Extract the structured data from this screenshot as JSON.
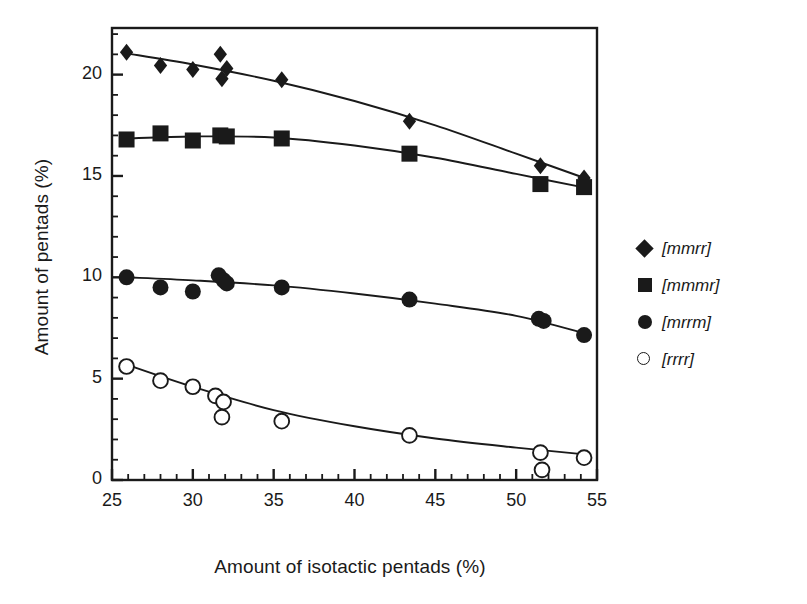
{
  "chart_data": {
    "type": "scatter",
    "title": "",
    "xlabel": "Amount of isotactic pentads (%)",
    "ylabel": "Amount of pentads (%)",
    "xlim": [
      25,
      55
    ],
    "ylim": [
      0,
      22.3
    ],
    "xticks": [
      25,
      30,
      35,
      40,
      45,
      50,
      55
    ],
    "yticks": [
      0,
      5,
      10,
      15,
      20
    ],
    "xtick_labels": [
      "25",
      "30",
      "35",
      "40",
      "45",
      "50",
      "55"
    ],
    "ytick_labels": [
      "0",
      "5",
      "10",
      "15",
      "20"
    ],
    "x_minor_step": 1,
    "y_minor_step": 1,
    "grid": false,
    "legend_position": "right",
    "series": [
      {
        "name": "[mmrr]",
        "marker": "filled-diamond",
        "color": "#1a1a1a",
        "points": [
          {
            "x": 25.9,
            "y": 21.1
          },
          {
            "x": 28.0,
            "y": 20.45
          },
          {
            "x": 30.0,
            "y": 20.25
          },
          {
            "x": 31.7,
            "y": 21.0
          },
          {
            "x": 31.8,
            "y": 19.8
          },
          {
            "x": 32.1,
            "y": 20.3
          },
          {
            "x": 35.5,
            "y": 19.75
          },
          {
            "x": 43.4,
            "y": 17.7
          },
          {
            "x": 51.5,
            "y": 15.5
          },
          {
            "x": 54.2,
            "y": 14.9
          }
        ],
        "fit_curve": [
          {
            "x": 25.9,
            "y": 21.05
          },
          {
            "x": 30.0,
            "y": 20.5
          },
          {
            "x": 35.0,
            "y": 19.7
          },
          {
            "x": 40.0,
            "y": 18.7
          },
          {
            "x": 45.0,
            "y": 17.5
          },
          {
            "x": 50.0,
            "y": 16.1
          },
          {
            "x": 54.4,
            "y": 14.85
          }
        ]
      },
      {
        "name": "[mmmr]",
        "marker": "filled-square",
        "color": "#1a1a1a",
        "points": [
          {
            "x": 25.9,
            "y": 16.8
          },
          {
            "x": 28.0,
            "y": 17.1
          },
          {
            "x": 30.0,
            "y": 16.75
          },
          {
            "x": 31.7,
            "y": 17.0
          },
          {
            "x": 32.1,
            "y": 16.95
          },
          {
            "x": 35.5,
            "y": 16.85
          },
          {
            "x": 43.4,
            "y": 16.1
          },
          {
            "x": 51.5,
            "y": 14.6
          },
          {
            "x": 54.2,
            "y": 14.45
          }
        ],
        "fit_curve": [
          {
            "x": 25.9,
            "y": 16.85
          },
          {
            "x": 30.0,
            "y": 16.95
          },
          {
            "x": 35.0,
            "y": 16.9
          },
          {
            "x": 40.0,
            "y": 16.5
          },
          {
            "x": 45.0,
            "y": 15.9
          },
          {
            "x": 50.0,
            "y": 15.1
          },
          {
            "x": 54.4,
            "y": 14.4
          }
        ]
      },
      {
        "name": "[mrrm]",
        "marker": "filled-circle",
        "color": "#1a1a1a",
        "points": [
          {
            "x": 25.9,
            "y": 10.0
          },
          {
            "x": 28.0,
            "y": 9.5
          },
          {
            "x": 30.0,
            "y": 9.3
          },
          {
            "x": 31.6,
            "y": 10.1
          },
          {
            "x": 31.9,
            "y": 9.85
          },
          {
            "x": 32.1,
            "y": 9.7
          },
          {
            "x": 35.5,
            "y": 9.5
          },
          {
            "x": 43.4,
            "y": 8.9
          },
          {
            "x": 51.4,
            "y": 7.95
          },
          {
            "x": 51.7,
            "y": 7.85
          },
          {
            "x": 54.2,
            "y": 7.15
          }
        ],
        "fit_curve": [
          {
            "x": 25.9,
            "y": 10.0
          },
          {
            "x": 30.0,
            "y": 9.85
          },
          {
            "x": 35.0,
            "y": 9.6
          },
          {
            "x": 40.0,
            "y": 9.2
          },
          {
            "x": 45.0,
            "y": 8.7
          },
          {
            "x": 50.0,
            "y": 8.1
          },
          {
            "x": 54.4,
            "y": 7.2
          }
        ]
      },
      {
        "name": "[rrrr]",
        "marker": "open-circle",
        "color": "#1a1a1a",
        "points": [
          {
            "x": 25.9,
            "y": 5.6
          },
          {
            "x": 28.0,
            "y": 4.9
          },
          {
            "x": 30.0,
            "y": 4.6
          },
          {
            "x": 31.4,
            "y": 4.15
          },
          {
            "x": 31.9,
            "y": 3.85
          },
          {
            "x": 31.8,
            "y": 3.1
          },
          {
            "x": 35.5,
            "y": 2.9
          },
          {
            "x": 43.4,
            "y": 2.2
          },
          {
            "x": 51.5,
            "y": 1.35
          },
          {
            "x": 51.6,
            "y": 0.5
          },
          {
            "x": 54.2,
            "y": 1.1
          }
        ],
        "fit_curve": [
          {
            "x": 25.7,
            "y": 5.75
          },
          {
            "x": 30.0,
            "y": 4.6
          },
          {
            "x": 35.0,
            "y": 3.45
          },
          {
            "x": 40.0,
            "y": 2.65
          },
          {
            "x": 45.0,
            "y": 2.05
          },
          {
            "x": 50.0,
            "y": 1.6
          },
          {
            "x": 54.4,
            "y": 1.25
          }
        ]
      }
    ]
  },
  "legend": {
    "items": [
      {
        "label": "[mmrr]",
        "marker": "filled-diamond"
      },
      {
        "label": "[mmmr]",
        "marker": "filled-square"
      },
      {
        "label": "[mrrm]",
        "marker": "filled-circle"
      },
      {
        "label": "[rrrr]",
        "marker": "open-circle"
      }
    ]
  }
}
